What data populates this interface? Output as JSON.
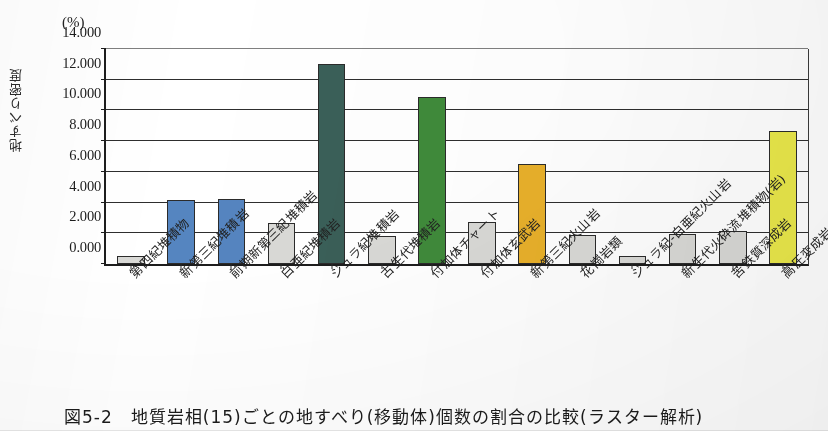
{
  "figure": {
    "unit_label": "(%)",
    "y_axis_title": "地すべり密度",
    "caption": "図5-2　地質岩相(15)ごとの地すべり(移動体)個数の割合の比較(ラスター解析)"
  },
  "chart_data": {
    "type": "bar",
    "title": "",
    "subtitle": "",
    "xlabel": "",
    "ylabel": "地すべり密度",
    "unit": "(%)",
    "ylim": [
      0.0,
      14.0
    ],
    "ytick_step": 2.0,
    "ytick_labels": [
      "14.000",
      "12.000",
      "10.000",
      "8.000",
      "6.000",
      "4.000",
      "2.000",
      "0.000"
    ],
    "ytick_values": [
      14.0,
      12.0,
      10.0,
      8.0,
      6.0,
      4.0,
      2.0,
      0.0
    ],
    "grid": true,
    "grid_axis": "y",
    "legend": "none",
    "categories": [
      "第四紀堆積物",
      "新第三紀堆積岩",
      "前期新第三紀堆積岩",
      "白亜紀堆積岩",
      "ジュラ紀堆積岩",
      "古生代堆積岩",
      "付加体チャート",
      "付加体玄武岩",
      "新第三紀火山岩",
      "花崗岩類",
      "ジュラ紀-白亜紀火山岩",
      "新生代火砕流堆積物(岩)",
      "苦鉄質深成岩",
      "高圧変成岩"
    ],
    "values": [
      0.55,
      4.2,
      4.22,
      2.7,
      13.0,
      1.85,
      10.9,
      2.75,
      6.5,
      1.9,
      0.5,
      1.95,
      2.15,
      8.65
    ],
    "bar_colors": [
      "#d9d9d6",
      "#5585c0",
      "#5585c0",
      "#d9d9d6",
      "#3a5f58",
      "#d9d9d6",
      "#3f8a3a",
      "#d9d9d6",
      "#e8b02a",
      "#d9d9d6",
      "#d9d9d6",
      "#d9d9d6",
      "#d9d9d6",
      "#eae84a"
    ],
    "bar_edge_color": "#2b2b2b",
    "axis_color": "#1d1d1d"
  }
}
